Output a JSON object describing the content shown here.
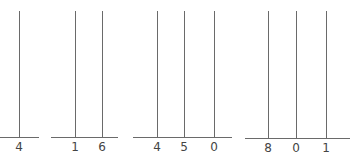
{
  "diagram": {
    "type": "abacus-place-value",
    "line_color": "#6a6a6a",
    "text_color": "#444444",
    "abaci": [
      {
        "value": "4",
        "baseline": {
          "x1": 0,
          "x2": 39,
          "y": 137
        },
        "rods": [
          {
            "x": 19,
            "digit": "4"
          }
        ]
      },
      {
        "value": "16",
        "baseline": {
          "x1": 51,
          "x2": 118,
          "y": 137
        },
        "rods": [
          {
            "x": 75,
            "digit": "1"
          },
          {
            "x": 102,
            "digit": "6"
          }
        ]
      },
      {
        "value": "450",
        "baseline": {
          "x1": 133,
          "x2": 232,
          "y": 137
        },
        "rods": [
          {
            "x": 157,
            "digit": "4"
          },
          {
            "x": 184,
            "digit": "5"
          },
          {
            "x": 214,
            "digit": "0"
          }
        ]
      },
      {
        "value": "801",
        "baseline": {
          "x1": 245,
          "x2": 350,
          "y": 138
        },
        "rods": [
          {
            "x": 268,
            "digit": "8"
          },
          {
            "x": 296,
            "digit": "0"
          },
          {
            "x": 326,
            "digit": "1"
          }
        ]
      }
    ],
    "rod_top": 11
  }
}
